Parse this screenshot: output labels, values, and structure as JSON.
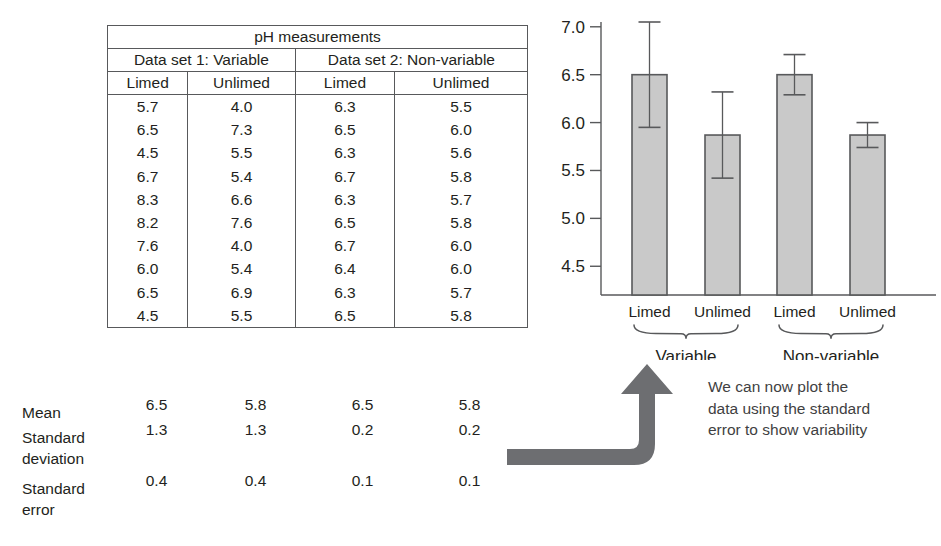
{
  "table": {
    "title": "pH measurements",
    "groups": [
      {
        "name": "Data set 1: Variable"
      },
      {
        "name": "Data set 2: Non-variable"
      }
    ],
    "columns": [
      "Limed",
      "Unlimed",
      "Limed",
      "Unlimed"
    ],
    "rows": [
      [
        "5.7",
        "4.0",
        "6.3",
        "5.5"
      ],
      [
        "6.5",
        "7.3",
        "6.5",
        "6.0"
      ],
      [
        "4.5",
        "5.5",
        "6.3",
        "5.6"
      ],
      [
        "6.7",
        "5.4",
        "6.7",
        "5.8"
      ],
      [
        "8.3",
        "6.6",
        "6.3",
        "5.7"
      ],
      [
        "8.2",
        "7.6",
        "6.5",
        "5.8"
      ],
      [
        "7.6",
        "4.0",
        "6.7",
        "6.0"
      ],
      [
        "6.0",
        "5.4",
        "6.4",
        "6.0"
      ],
      [
        "6.5",
        "6.9",
        "6.3",
        "5.7"
      ],
      [
        "4.5",
        "5.5",
        "6.5",
        "5.8"
      ]
    ],
    "stats": [
      {
        "label": "Mean",
        "label_line1": "Mean",
        "label_line2": "",
        "values": [
          "6.5",
          "5.8",
          "6.5",
          "5.8"
        ]
      },
      {
        "label": "Standard deviation",
        "label_line1": "Standard",
        "label_line2": "deviation",
        "values": [
          "1.3",
          "1.3",
          "0.2",
          "0.2"
        ]
      },
      {
        "label": "Standard error",
        "label_line1": "Standard",
        "label_line2": "error",
        "values": [
          "0.4",
          "0.4",
          "0.1",
          "0.1"
        ]
      }
    ]
  },
  "chart_data": {
    "type": "bar",
    "title": "",
    "xlabel": "",
    "ylabel": "",
    "ylim": [
      4.2,
      7.05
    ],
    "yticks": [
      "7.0",
      "6.5",
      "6.0",
      "5.5",
      "5.0",
      "4.5"
    ],
    "ytick_values": [
      7.0,
      6.5,
      6.0,
      5.5,
      5.0,
      4.5
    ],
    "grid": false,
    "legend": false,
    "categories": [
      "Limed",
      "Unlimed",
      "Limed",
      "Unlimed"
    ],
    "group_labels": [
      "Variable",
      "Non-variable"
    ],
    "values": [
      6.5,
      5.87,
      6.5,
      5.87
    ],
    "errors": [
      0.55,
      0.45,
      0.21,
      0.13
    ],
    "error_type": "standard error",
    "bar_fill": "#c9c9c9",
    "bar_stroke": "#58595b",
    "axis_color": "#58595b"
  },
  "annotation": {
    "line1": "We can now plot the",
    "line2": "data using the standard",
    "line3": "error to show variability",
    "arrow_color": "#6d6e71"
  }
}
